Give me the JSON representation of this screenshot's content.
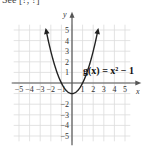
{
  "header": {
    "top_text": "See [?, ?]"
  },
  "chart_data": {
    "type": "line",
    "title": "",
    "equation_label": "g(x) = x² − 1",
    "xlabel": "x",
    "ylabel": "y",
    "xlim": [
      -5.5,
      5.5
    ],
    "ylim": [
      -5.5,
      5.5
    ],
    "grid": true,
    "x_ticks": [
      -5,
      -4,
      -3,
      -2,
      -1,
      1,
      2,
      3,
      4,
      5
    ],
    "y_ticks": [
      -5,
      -4,
      -3,
      -2,
      1,
      2,
      3,
      4,
      5
    ],
    "x_tick_labels": [
      "−5",
      "−4",
      "−3",
      "−2",
      "−1",
      "1",
      "2",
      "3",
      "4",
      "5"
    ],
    "y_tick_labels_pos": [
      "1",
      "2",
      "3",
      "4",
      "5"
    ],
    "y_tick_labels_neg": [
      "−2",
      "−3",
      "−4",
      "−5"
    ],
    "series": [
      {
        "name": "g(x) = x^2 - 1",
        "x": [
          -2.5,
          -2,
          -1.5,
          -1,
          -0.5,
          0,
          0.5,
          1,
          1.5,
          2,
          2.5
        ],
        "y": [
          5.25,
          3,
          1.25,
          0,
          -0.75,
          -1,
          -0.75,
          0,
          1.25,
          3,
          5.25
        ]
      }
    ],
    "vertex": [
      0,
      -1
    ],
    "x_intercepts": [
      -1,
      1
    ]
  }
}
